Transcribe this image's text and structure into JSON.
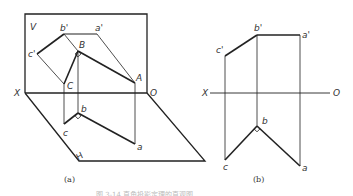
{
  "figure_a": {
    "caption": "(a)",
    "plane_v_label": "V",
    "plane_h_label": "H",
    "axis_x_label": "X",
    "axis_o_label": "O",
    "points": {
      "b_prime": "b'",
      "a_prime": "a'",
      "c_prime": "c'",
      "B": "B",
      "A": "A",
      "C": "C",
      "b": "b",
      "c": "c",
      "a": "a"
    }
  },
  "figure_b": {
    "caption": "(b)",
    "axis_x_label": "X",
    "axis_o_label": "O",
    "points": {
      "c_prime": "c'",
      "b_prime": "b'",
      "a_prime": "a'",
      "b": "b",
      "c": "c",
      "a": "a"
    }
  },
  "figure_caption": "图 3-14  直角投影定理的直观图"
}
